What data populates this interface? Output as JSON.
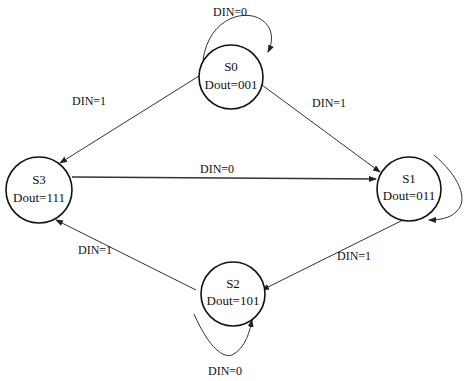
{
  "diagram": {
    "type": "state-machine",
    "states": [
      {
        "id": "S0",
        "name": "S0",
        "output": "Dout=001",
        "cx": 231,
        "cy": 77
      },
      {
        "id": "S1",
        "name": "S1",
        "output": "Dout=011",
        "cx": 409,
        "cy": 189
      },
      {
        "id": "S2",
        "name": "S2",
        "output": "Dout=101",
        "cx": 233,
        "cy": 294
      },
      {
        "id": "S3",
        "name": "S3",
        "output": "Dout=111",
        "cx": 39,
        "cy": 190
      }
    ],
    "transitions": [
      {
        "from": "S0",
        "to": "S0",
        "label": "DIN=0"
      },
      {
        "from": "S0",
        "to": "S1",
        "label": "DIN=1"
      },
      {
        "from": "S0",
        "to": "S3",
        "label": "DIN=1"
      },
      {
        "from": "S3",
        "to": "S1",
        "label": "DIN=0"
      },
      {
        "from": "S1",
        "to": "S1",
        "label": ""
      },
      {
        "from": "S1",
        "to": "S2",
        "label": "DIN=1"
      },
      {
        "from": "S2",
        "to": "S2",
        "label": "DIN=0"
      },
      {
        "from": "S2",
        "to": "S3",
        "label": "DIN=1"
      }
    ]
  }
}
